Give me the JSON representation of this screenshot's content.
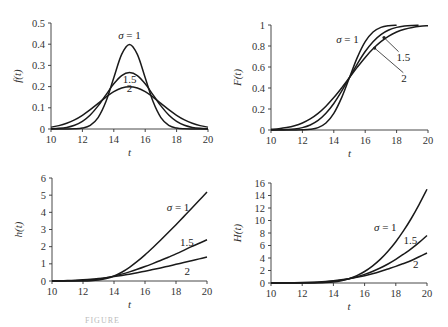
{
  "figure": {
    "caption_visible": "FIGURE"
  },
  "chart_data": [
    {
      "id": "pdf",
      "type": "line",
      "title": "",
      "xlabel": "t",
      "ylabel": "f(t)",
      "xlim": [
        10,
        20
      ],
      "ylim": [
        0,
        0.5
      ],
      "xticks": [
        10,
        12,
        14,
        16,
        18,
        20
      ],
      "yticks": [
        0,
        0.1,
        0.2,
        0.3,
        0.4,
        0.5
      ],
      "ytick_labels": [
        "0",
        "0.1",
        "0.2",
        "0.3",
        "0.4",
        "0.5"
      ],
      "grid": false,
      "box": {
        "left": 51,
        "top": 23,
        "right": 208,
        "bottom": 129
      },
      "annotations": [
        {
          "text": "σ = 1",
          "x": 15,
          "y": 0.425,
          "anchor": "middle"
        },
        {
          "text": "1.5",
          "x": 15,
          "y": 0.218,
          "anchor": "middle"
        },
        {
          "text": "2",
          "x": 15,
          "y": 0.175,
          "anchor": "middle"
        }
      ],
      "x": [
        10,
        10.5,
        11,
        11.5,
        12,
        12.5,
        13,
        13.5,
        14,
        14.5,
        15,
        15.5,
        16,
        16.5,
        17,
        17.5,
        18,
        18.5,
        19,
        19.5,
        20
      ],
      "series": [
        {
          "name": "σ = 1",
          "values": [
            0,
            0,
            0.0001,
            0.0009,
            0.0044,
            0.0175,
            0.054,
            0.1295,
            0.242,
            0.352,
            0.399,
            0.352,
            0.242,
            0.1295,
            0.054,
            0.0175,
            0.0044,
            0.0009,
            0.0001,
            0,
            0
          ]
        },
        {
          "name": "σ = 1.5",
          "values": [
            0.001,
            0.003,
            0.0076,
            0.0175,
            0.036,
            0.0663,
            0.109,
            0.161,
            0.213,
            0.252,
            0.266,
            0.252,
            0.213,
            0.161,
            0.109,
            0.0663,
            0.036,
            0.0175,
            0.0076,
            0.003,
            0.001
          ]
        },
        {
          "name": "σ = 2",
          "values": [
            0.0088,
            0.0159,
            0.027,
            0.0431,
            0.0648,
            0.0913,
            0.121,
            0.1506,
            0.176,
            0.193,
            0.1995,
            0.193,
            0.176,
            0.1506,
            0.121,
            0.0913,
            0.0648,
            0.0431,
            0.027,
            0.0159,
            0.0088
          ]
        }
      ]
    },
    {
      "id": "cdf",
      "type": "line",
      "title": "",
      "xlabel": "t",
      "ylabel": "F(t)",
      "xlim": [
        10,
        20
      ],
      "ylim": [
        0,
        1
      ],
      "xticks": [
        10,
        12,
        14,
        16,
        18,
        20
      ],
      "yticks": [
        0,
        0.2,
        0.4,
        0.6,
        0.8,
        1
      ],
      "ytick_labels": [
        "0",
        "0.2",
        "0.4",
        "0.6",
        "0.8",
        "1"
      ],
      "grid": false,
      "box": {
        "left": 271,
        "top": 25,
        "right": 428,
        "bottom": 130
      },
      "annotations": [
        {
          "text": "σ = 1",
          "x": 14.15,
          "y": 0.83,
          "anchor": "start"
        },
        {
          "text": "1.5",
          "x": 18.0,
          "y": 0.66,
          "anchor": "start",
          "arrow_to": [
            17.2,
            0.88
          ]
        },
        {
          "text": "2",
          "x": 18.3,
          "y": 0.46,
          "anchor": "start",
          "arrow_to": [
            16.6,
            0.78
          ]
        }
      ],
      "series": [
        {
          "name": "σ = 1",
          "x": [
            10,
            10.5,
            11,
            11.5,
            12,
            12.5,
            13,
            13.5,
            14,
            14.5,
            15,
            15.5,
            16,
            16.5,
            17,
            17.5,
            18
          ],
          "values": [
            0,
            0,
            0,
            0.0002,
            0.0013,
            0.0062,
            0.0228,
            0.0668,
            0.1587,
            0.3085,
            0.5,
            0.6915,
            0.8413,
            0.9332,
            0.9772,
            0.9938,
            0.9987
          ]
        },
        {
          "name": "σ = 1.5",
          "x": [
            10,
            10.5,
            11,
            11.5,
            12,
            12.5,
            13,
            13.5,
            14,
            14.5,
            15,
            15.5,
            16,
            16.5,
            17,
            17.5,
            18,
            18.5,
            19,
            19.4
          ],
          "values": [
            0.0004,
            0.0013,
            0.0038,
            0.0098,
            0.0228,
            0.0478,
            0.0912,
            0.1587,
            0.2525,
            0.3694,
            0.5,
            0.6306,
            0.7475,
            0.8413,
            0.9088,
            0.9522,
            0.9772,
            0.9902,
            0.9962,
            0.9981
          ]
        },
        {
          "name": "σ = 2",
          "x": [
            10,
            10.5,
            11,
            11.5,
            12,
            12.5,
            13,
            13.5,
            14,
            14.5,
            15,
            15.5,
            16,
            16.5,
            17,
            17.5,
            18,
            18.5,
            19,
            19.5,
            20
          ],
          "values": [
            0.0062,
            0.0122,
            0.0228,
            0.0401,
            0.0668,
            0.1056,
            0.1587,
            0.2266,
            0.3085,
            0.4013,
            0.5,
            0.5987,
            0.6915,
            0.7734,
            0.8413,
            0.8944,
            0.9332,
            0.9599,
            0.9772,
            0.9878,
            0.9938
          ]
        }
      ]
    },
    {
      "id": "hazard",
      "type": "line",
      "title": "",
      "xlabel": "t",
      "ylabel": "h(t)",
      "xlim": [
        10,
        20
      ],
      "ylim": [
        0,
        6
      ],
      "xticks": [
        10,
        12,
        14,
        16,
        18,
        20
      ],
      "yticks": [
        0,
        1,
        2,
        3,
        4,
        5,
        6
      ],
      "ytick_labels": [
        "0",
        "1",
        "2",
        "3",
        "4",
        "5",
        "6"
      ],
      "grid": false,
      "box": {
        "left": 52,
        "top": 178,
        "right": 207,
        "bottom": 281
      },
      "annotations": [
        {
          "text": "σ  = 1",
          "x": 17.4,
          "y": 4.1,
          "anchor": "start"
        },
        {
          "text": "1.5",
          "x": 18.25,
          "y": 2.05,
          "anchor": "start"
        },
        {
          "text": "2",
          "x": 18.55,
          "y": 0.35,
          "anchor": "start"
        }
      ],
      "x": [
        10,
        10.5,
        11,
        11.5,
        12,
        12.5,
        13,
        13.5,
        14,
        14.5,
        15,
        15.5,
        16,
        16.5,
        17,
        17.5,
        18,
        18.5,
        19,
        19.5,
        20
      ],
      "series": [
        {
          "name": "σ = 1",
          "values": [
            0,
            0,
            0.0001,
            0.0009,
            0.0044,
            0.0176,
            0.0553,
            0.139,
            0.288,
            0.509,
            0.798,
            1.141,
            1.525,
            1.94,
            2.37,
            2.82,
            3.28,
            3.75,
            4.22,
            4.7,
            5.19
          ]
        },
        {
          "name": "σ = 1.5",
          "values": [
            0.001,
            0.003,
            0.0076,
            0.0177,
            0.0368,
            0.0696,
            0.12,
            0.191,
            0.285,
            0.4,
            0.532,
            0.682,
            0.843,
            1.015,
            1.195,
            1.387,
            1.579,
            1.786,
            2.0,
            2.2,
            2.4
          ]
        },
        {
          "name": "σ = 2",
          "values": [
            0.0089,
            0.0161,
            0.0276,
            0.0449,
            0.0695,
            0.102,
            0.144,
            0.195,
            0.255,
            0.323,
            0.399,
            0.482,
            0.571,
            0.665,
            0.762,
            0.865,
            0.97,
            1.075,
            1.18,
            1.29,
            1.4
          ]
        }
      ]
    },
    {
      "id": "cumhazard",
      "type": "line",
      "title": "",
      "xlabel": "t",
      "ylabel": "H(t)",
      "xlim": [
        10,
        20
      ],
      "ylim": [
        0,
        16
      ],
      "xticks": [
        10,
        12,
        14,
        16,
        18,
        20
      ],
      "yticks": [
        0,
        2,
        4,
        6,
        8,
        10,
        12,
        14,
        16
      ],
      "ytick_labels": [
        "0",
        "2",
        "4",
        "6",
        "8",
        "10",
        "12",
        "14",
        "16"
      ],
      "grid": false,
      "box": {
        "left": 271,
        "top": 183,
        "right": 427,
        "bottom": 283
      },
      "annotations": [
        {
          "text": "σ  = 1",
          "x": 16.6,
          "y": 8.4,
          "anchor": "start"
        },
        {
          "text": "1.5",
          "x": 18.5,
          "y": 6.3,
          "anchor": "start"
        },
        {
          "text": "2",
          "x": 19.1,
          "y": 2.4,
          "anchor": "start"
        }
      ],
      "x": [
        10,
        10.5,
        11,
        11.5,
        12,
        12.5,
        13,
        13.5,
        14,
        14.5,
        15,
        15.5,
        16,
        16.5,
        17,
        17.5,
        18,
        18.5,
        19,
        19.5,
        20
      ],
      "series": [
        {
          "name": "σ = 1",
          "values": [
            0,
            0,
            0,
            0.0002,
            0.0013,
            0.0062,
            0.0231,
            0.0691,
            0.173,
            0.369,
            0.693,
            1.176,
            1.841,
            2.706,
            3.78,
            5.08,
            6.61,
            8.37,
            10.36,
            12.59,
            15.0
          ]
        },
        {
          "name": "σ = 1.5",
          "values": [
            0.0004,
            0.0013,
            0.0038,
            0.0098,
            0.0231,
            0.049,
            0.0956,
            0.173,
            0.291,
            0.461,
            0.693,
            0.996,
            1.376,
            1.841,
            2.395,
            3.04,
            3.78,
            4.62,
            5.5,
            6.5,
            7.6
          ]
        },
        {
          "name": "σ = 2",
          "values": [
            0.0062,
            0.0123,
            0.0231,
            0.0409,
            0.0691,
            0.1116,
            0.173,
            0.257,
            0.369,
            0.513,
            0.693,
            0.913,
            1.176,
            1.485,
            1.841,
            2.248,
            2.66,
            3.12,
            3.6,
            4.2,
            4.8
          ]
        }
      ]
    }
  ]
}
